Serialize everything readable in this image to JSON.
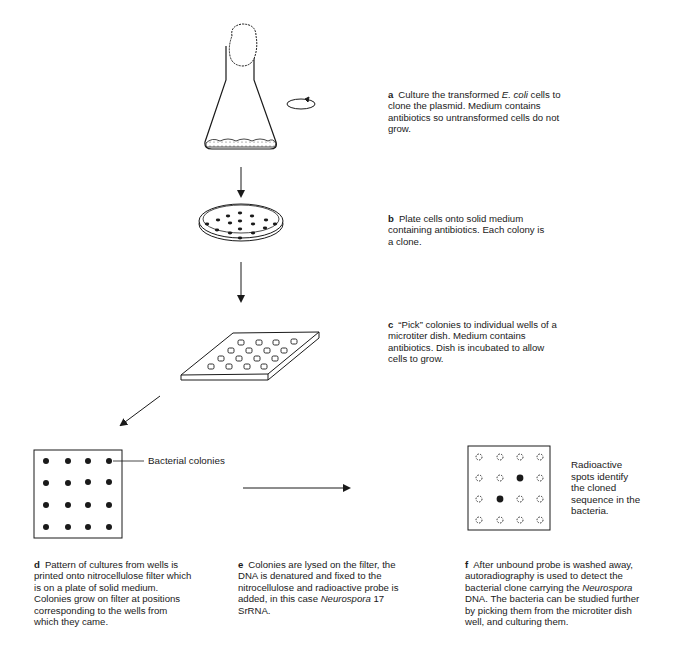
{
  "figure": {
    "steps": [
      {
        "letter": "a",
        "pre": "Culture the transformed ",
        "italic": "E. coli",
        "post": " cells to clone the plasmid. Medium contains antibiotics so untransformed cells do not grow."
      },
      {
        "letter": "b",
        "pre": "Plate cells onto solid medium containing antibiotics. Each colony is a clone.",
        "italic": "",
        "post": ""
      },
      {
        "letter": "c",
        "pre": "“Pick” colonies to individual wells of a microtiter dish. Medium contains antibiotics. Dish is incubated to allow cells to grow.",
        "italic": "",
        "post": ""
      },
      {
        "letter": "d",
        "pre": "Pattern of cultures from wells is printed onto nitrocellulose filter which is on a plate of solid medium. Colonies grow on filter at positions corresponding to the wells from which they came.",
        "italic": "",
        "post": ""
      },
      {
        "letter": "e",
        "pre": "Colonies are lysed on the filter, the DNA is denatured and fixed to the nitrocellulose and radioactive probe is added, in this case ",
        "italic": "Neurospora",
        "post": " 17 SrRNA."
      },
      {
        "letter": "f",
        "pre": "After unbound probe is washed away, autoradiography is used to detect the bacterial clone carrying the ",
        "italic": "Neurospora",
        "post": " DNA. The bacteria can be studied further by picking them from the microtiter dish well, and culturing them."
      }
    ],
    "labels": {
      "bacterial_colonies": "Bacterial colonies",
      "radioactive_spots": "Radioactive spots identify the cloned sequence in the bacteria."
    },
    "filter_grid": {
      "rows": 4,
      "cols": 4
    },
    "autoradiograph_hits": [
      [
        1,
        2
      ],
      [
        2,
        1
      ]
    ],
    "colors": {
      "ink": "#1a1a1a",
      "background": "#ffffff"
    }
  }
}
